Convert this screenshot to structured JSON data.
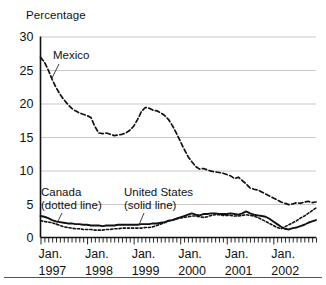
{
  "axis_title": "Percentage",
  "annotations": {
    "mexico": "Mexico",
    "canada_line1": "Canada",
    "canada_line2": "(dotted line)",
    "us_line1": "United States",
    "us_line2": "(solid line)"
  },
  "chart_data": {
    "type": "line",
    "title": "",
    "subtitle": "",
    "xlabel": "",
    "ylabel": "Percentage",
    "ylim": [
      0,
      30
    ],
    "yticks": [
      0,
      5,
      10,
      15,
      20,
      25,
      30
    ],
    "ytick_labels": [
      "0",
      "5",
      "10",
      "15",
      "20",
      "25",
      "30"
    ],
    "xlim": [
      "Jan. 1997",
      "Dec. 2002"
    ],
    "xtick_months": [
      "Jan.",
      "Jan.",
      "Jan.",
      "Jan.",
      "Jan.",
      "Jan."
    ],
    "xtick_years": [
      "1997",
      "1998",
      "1999",
      "2000",
      "2001",
      "2002"
    ],
    "xtick_positions_months": [
      0,
      12,
      24,
      36,
      48,
      60
    ],
    "minor_ticks": "monthly",
    "grid": "horizontal",
    "legend_position": "inline-annotations",
    "x": [
      "Jan. 1997",
      "Feb. 1997",
      "Mar. 1997",
      "Apr. 1997",
      "May 1997",
      "Jun. 1997",
      "Jul. 1997",
      "Aug. 1997",
      "Sep. 1997",
      "Oct. 1997",
      "Nov. 1997",
      "Dec. 1997",
      "Jan. 1998",
      "Feb. 1998",
      "Mar. 1998",
      "Apr. 1998",
      "May 1998",
      "Jun. 1998",
      "Jul. 1998",
      "Aug. 1998",
      "Sep. 1998",
      "Oct. 1998",
      "Nov. 1998",
      "Dec. 1998",
      "Jan. 1999",
      "Feb. 1999",
      "Mar. 1999",
      "Apr. 1999",
      "May 1999",
      "Jun. 1999",
      "Jul. 1999",
      "Aug. 1999",
      "Sep. 1999",
      "Oct. 1999",
      "Nov. 1999",
      "Dec. 1999",
      "Jan. 2000",
      "Feb. 2000",
      "Mar. 2000",
      "Apr. 2000",
      "May 2000",
      "Jun. 2000",
      "Jul. 2000",
      "Aug. 2000",
      "Sep. 2000",
      "Oct. 2000",
      "Nov. 2000",
      "Dec. 2000",
      "Jan. 2001",
      "Feb. 2001",
      "Mar. 2001",
      "Apr. 2001",
      "May 2001",
      "Jun. 2001",
      "Jul. 2001",
      "Aug. 2001",
      "Sep. 2001",
      "Oct. 2001",
      "Nov. 2001",
      "Dec. 2001",
      "Jan. 2002",
      "Feb. 2002",
      "Mar. 2002",
      "Apr. 2002",
      "May 2002",
      "Jun. 2002",
      "Jul. 2002",
      "Aug. 2002",
      "Sep. 2002",
      "Oct. 2002",
      "Nov. 2002",
      "Dec. 2002"
    ],
    "series": [
      {
        "name": "Mexico",
        "style": "dashed",
        "color": "#111111",
        "values": [
          26.9,
          26.2,
          25.0,
          23.6,
          22.4,
          21.4,
          20.6,
          19.9,
          19.3,
          18.9,
          18.6,
          18.4,
          18.2,
          17.9,
          16.6,
          15.6,
          15.5,
          15.6,
          15.4,
          15.2,
          15.3,
          15.4,
          15.6,
          16.0,
          16.6,
          17.6,
          18.8,
          19.4,
          19.3,
          19.0,
          18.9,
          18.6,
          18.2,
          17.6,
          16.7,
          15.6,
          14.4,
          13.2,
          12.1,
          11.3,
          10.6,
          10.2,
          10.3,
          10.1,
          9.9,
          9.8,
          9.7,
          9.6,
          9.4,
          9.2,
          8.8,
          9.0,
          8.5,
          8.0,
          7.4,
          7.2,
          7.1,
          6.8,
          6.5,
          6.2,
          5.9,
          5.6,
          5.3,
          5.1,
          4.9,
          5.0,
          5.2,
          5.1,
          5.3,
          5.4,
          5.2,
          5.3
        ]
      },
      {
        "name": "United States",
        "style": "solid",
        "color": "#111111",
        "values": [
          3.2,
          3.1,
          2.9,
          2.6,
          2.4,
          2.3,
          2.2,
          2.1,
          2.1,
          2.0,
          2.0,
          1.9,
          1.9,
          1.8,
          1.8,
          1.8,
          1.7,
          1.8,
          1.8,
          1.8,
          1.9,
          1.9,
          1.9,
          1.9,
          1.9,
          1.9,
          2.0,
          2.0,
          2.0,
          2.1,
          2.1,
          2.2,
          2.3,
          2.5,
          2.6,
          2.8,
          3.0,
          3.2,
          3.4,
          3.6,
          3.4,
          3.3,
          3.5,
          3.5,
          3.6,
          3.6,
          3.5,
          3.5,
          3.5,
          3.6,
          3.5,
          3.4,
          3.6,
          3.9,
          3.6,
          3.4,
          3.3,
          3.2,
          3.1,
          2.8,
          2.4,
          2.0,
          1.6,
          1.3,
          1.2,
          1.4,
          1.5,
          1.7,
          1.9,
          2.2,
          2.4,
          2.6
        ]
      },
      {
        "name": "Canada",
        "style": "dotted",
        "color": "#111111",
        "values": [
          2.5,
          2.4,
          2.3,
          2.2,
          2.0,
          1.8,
          1.6,
          1.5,
          1.4,
          1.3,
          1.3,
          1.2,
          1.2,
          1.2,
          1.1,
          1.1,
          1.1,
          1.2,
          1.2,
          1.3,
          1.3,
          1.4,
          1.4,
          1.4,
          1.4,
          1.4,
          1.4,
          1.5,
          1.5,
          1.6,
          1.8,
          2.0,
          2.2,
          2.5,
          2.6,
          2.8,
          2.9,
          3.0,
          3.1,
          3.2,
          3.2,
          3.1,
          3.0,
          3.1,
          3.3,
          3.4,
          3.4,
          3.3,
          3.3,
          3.3,
          3.2,
          3.2,
          3.3,
          3.4,
          3.3,
          3.2,
          3.0,
          2.7,
          2.4,
          2.1,
          1.8,
          1.5,
          1.3,
          1.6,
          1.9,
          2.2,
          2.5,
          2.9,
          3.2,
          3.6,
          4.0,
          4.4
        ]
      }
    ]
  }
}
